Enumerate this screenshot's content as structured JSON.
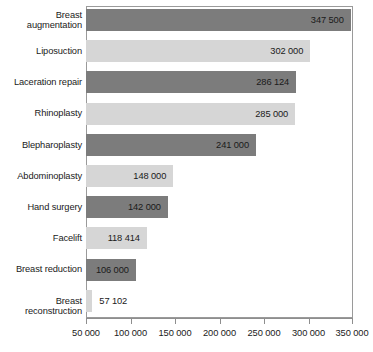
{
  "chart_data": {
    "type": "bar",
    "orientation": "horizontal",
    "title": "",
    "subtitle": "",
    "xlabel": "",
    "ylabel": "",
    "categories": [
      "Breast\naugmentation",
      "Liposuction",
      "Laceration repair",
      "Rhinoplasty",
      "Blepharoplasty",
      "Abdominoplasty",
      "Hand surgery",
      "Facelift",
      "Breast reduction",
      "Breast reconstruction"
    ],
    "values": [
      347500,
      302000,
      286124,
      285000,
      241000,
      148000,
      142000,
      118414,
      106000,
      57102
    ],
    "value_labels": [
      "347 500",
      "302 000",
      "286 124",
      "285 000",
      "241 000",
      "148 000",
      "142 000",
      "118 414",
      "106 000",
      "57 102"
    ],
    "bar_colors": [
      "dark",
      "light",
      "dark",
      "light",
      "dark",
      "light",
      "dark",
      "light",
      "dark",
      "light"
    ],
    "label_placement": [
      "inside",
      "inside",
      "inside",
      "inside",
      "inside",
      "inside",
      "inside",
      "inside",
      "inside",
      "outside"
    ],
    "xlim": [
      50000,
      350000
    ],
    "xticks": [
      50000,
      100000,
      150000,
      200000,
      250000,
      300000,
      350000
    ],
    "xtick_labels": [
      "50 000",
      "100 000",
      "150 000",
      "200 000",
      "250 000",
      "300 000",
      "350 000"
    ],
    "grid": false,
    "legend": null,
    "colors": {
      "dark_bar": "#7c7c7c",
      "light_bar": "#d6d6d6",
      "axis": "#8e8e8e",
      "frame": "#9a9a9a",
      "text": "#1a1a1a",
      "background": "#ffffff"
    }
  }
}
